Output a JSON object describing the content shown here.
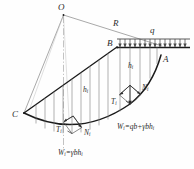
{
  "figure": {
    "labels": {
      "center_point": "O",
      "radius": "R",
      "surcharge": "q",
      "crest_point": "B",
      "slope_toe_right": "A",
      "slip_exit_left": "C",
      "slice_height_left": "h",
      "slice_height_left_sub": "i",
      "slice_height_right": "h",
      "slice_height_right_sub": "i",
      "tangential_force_left": "T",
      "tangential_force_left_sub": "i",
      "normal_force_left": "N",
      "normal_force_left_sub": "i",
      "tangential_force_right": "T",
      "tangential_force_right_sub": "i",
      "normal_force_right": "N",
      "normal_force_right_sub": "i",
      "weight_eq_left_lhs": "W",
      "weight_eq_left_sub": "i",
      "weight_eq_left_rhs": "=γbh",
      "weight_eq_left_rhs_sub": "i",
      "weight_eq_right_lhs": "W",
      "weight_eq_right_sub": "i",
      "weight_eq_right_rhs": "=qb+γbh",
      "weight_eq_right_rhs_sub": "i"
    },
    "colors": {
      "line": "#3a3a3a",
      "thin_line": "#8c8c8c",
      "heavy_line": "#1a1a1a",
      "text": "#2b2b2b",
      "background": "#ffffff"
    },
    "geometry": {
      "center_o": [
        63,
        14
      ],
      "point_c": [
        24,
        113
      ],
      "point_b": [
        117,
        47
      ],
      "point_a": [
        160,
        56
      ],
      "load_bar_left": 117,
      "load_bar_right": 190,
      "load_bar_y": 44,
      "slip_arc_radius": 101
    }
  }
}
